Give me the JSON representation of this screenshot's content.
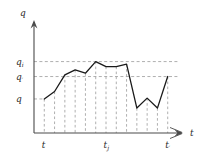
{
  "figure": {
    "axis_color": "#4a4a4a",
    "curve_color": "#1a1a1a",
    "guide_color": "#9a9a9a",
    "y_axis_label": "q",
    "x_axis_label": "t",
    "y_ticks": [
      {
        "key": "q_i",
        "base": "q",
        "sub": "i",
        "value": 0.86
      },
      {
        "key": "q_prime",
        "base": "q",
        "sub": "′",
        "value": 0.68
      },
      {
        "key": "q",
        "base": "q",
        "sub": "",
        "value": 0.41
      }
    ],
    "x_ticks": [
      {
        "key": "t",
        "base": "t",
        "sub": "",
        "value": 1
      },
      {
        "key": "t_j",
        "base": "t",
        "sub": "j",
        "value": 7
      },
      {
        "key": "t_prime",
        "base": "t",
        "sub": "′",
        "value": 13
      }
    ]
  },
  "chart_data": {
    "type": "line",
    "title": "",
    "xlabel": "t",
    "ylabel": "q",
    "grid": false,
    "legend": "none",
    "xlim": [
      0,
      14
    ],
    "ylim": [
      0,
      1.12
    ],
    "x": [
      1,
      2,
      3,
      4,
      5,
      6,
      7,
      8,
      9,
      10,
      11,
      12,
      13
    ],
    "values": [
      0.41,
      0.5,
      0.7,
      0.76,
      0.72,
      0.86,
      0.8,
      0.8,
      0.83,
      0.3,
      0.42,
      0.3,
      0.68
    ],
    "guide_lines": {
      "horizontal": [
        0.86,
        0.68,
        0.41
      ],
      "vertical": [
        1,
        2,
        3,
        4,
        5,
        6,
        7,
        8,
        9,
        10,
        11,
        12,
        13
      ]
    },
    "annotations": [
      {
        "text": "q_i",
        "axis": "y",
        "at": 0.86
      },
      {
        "text": "q'",
        "axis": "y",
        "at": 0.68
      },
      {
        "text": "q",
        "axis": "y",
        "at": 0.41
      },
      {
        "text": "t",
        "axis": "x",
        "at": 1
      },
      {
        "text": "t_j",
        "axis": "x",
        "at": 7
      },
      {
        "text": "t'",
        "axis": "x",
        "at": 13
      }
    ]
  }
}
